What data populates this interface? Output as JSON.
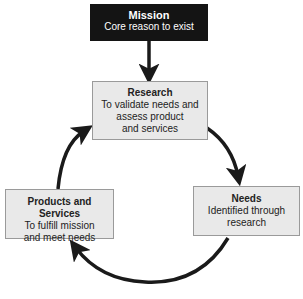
{
  "diagram": {
    "mission": {
      "title": "Mission",
      "desc": "Core reason to exist"
    },
    "research": {
      "title": "Research",
      "desc": "To validate needs and\nassess product\nand services"
    },
    "needs": {
      "title": "Needs",
      "desc": "Identified through\nresearch"
    },
    "products": {
      "title": "Products and Services",
      "desc": "To fulfill mission\nand meet needs"
    },
    "flow": [
      "Mission → Research",
      "Research → Needs",
      "Needs → Products and Services",
      "Products and Services → Research"
    ],
    "colors": {
      "mission_bg": "#141414",
      "box_bg": "#e9e9e9",
      "arrow": "#1a1a1a"
    }
  }
}
